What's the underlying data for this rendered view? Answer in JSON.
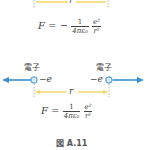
{
  "top_diagram": {
    "distance_label": "r",
    "formula": {
      "lhs": "F = −",
      "frac1_num": "1",
      "frac1_den": "4πε₀",
      "frac2_num": "e²",
      "frac2_den": "r²"
    }
  },
  "bottom_diagram": {
    "left_particle": {
      "label": "電子",
      "charge": "−e"
    },
    "right_particle": {
      "label": "電子",
      "charge": "−e"
    },
    "distance_label": "r",
    "formula": {
      "lhs": "F =",
      "frac1_num": "1",
      "frac1_den": "4πε₀",
      "frac2_num": "e²",
      "frac2_den": "r²"
    }
  },
  "caption": "図 A.11",
  "colors": {
    "arrow_blue": "#3a8fd0",
    "distance_yellow": "#f2d660",
    "particle_fill": "#d8ecf8",
    "dashed": "#999999"
  }
}
